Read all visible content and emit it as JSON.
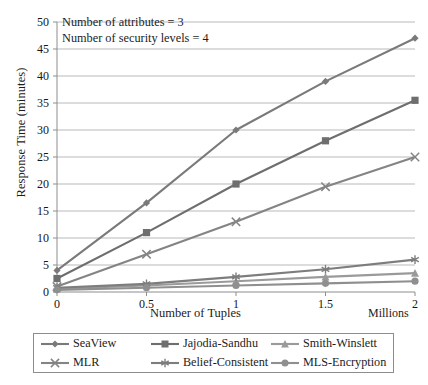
{
  "chart_data": {
    "type": "line",
    "title": "",
    "xlabel": "Number of Tuples",
    "xunits": "Millions",
    "ylabel": "Response Time (minutes)",
    "x": [
      0,
      0.5,
      1,
      1.5,
      2
    ],
    "xtick_labels": [
      "0",
      "0.5",
      "1",
      "1.5",
      "2"
    ],
    "ytick_labels": [
      "0",
      "5",
      "10",
      "15",
      "20",
      "25",
      "30",
      "35",
      "40",
      "45",
      "50"
    ],
    "xlim": [
      0,
      2
    ],
    "ylim": [
      0,
      50
    ],
    "grid": "horizontal",
    "legend_position": "below",
    "annotations": [
      "Number of attributes = 3",
      "Number of security levels = 4"
    ],
    "series": [
      {
        "name": "SeaView",
        "marker": "diamond",
        "color": "#7a7a7a",
        "values": [
          4,
          16.5,
          30,
          39,
          47
        ]
      },
      {
        "name": "Jajodia-Sandhu",
        "marker": "square",
        "color": "#6e6e6e",
        "values": [
          2.5,
          11,
          20,
          28,
          35.5
        ]
      },
      {
        "name": "Smith-Winslett",
        "marker": "triangle",
        "color": "#9a9a9a",
        "values": [
          0.6,
          1.2,
          2,
          2.8,
          3.5
        ]
      },
      {
        "name": "MLR",
        "marker": "cross",
        "color": "#848484",
        "values": [
          1,
          7,
          13,
          19.5,
          25
        ]
      },
      {
        "name": "Belief-Consistent",
        "marker": "asterisk",
        "color": "#7d7d7d",
        "values": [
          0.8,
          1.5,
          2.8,
          4.2,
          6
        ]
      },
      {
        "name": "MLS-Encryption",
        "marker": "circle",
        "color": "#8f8f8f",
        "values": [
          0.4,
          0.8,
          1.2,
          1.6,
          2
        ]
      }
    ]
  },
  "legend": {
    "items": [
      {
        "label": "SeaView",
        "marker": "diamond-marker-icon"
      },
      {
        "label": "Jajodia-Sandhu",
        "marker": "square-marker-icon"
      },
      {
        "label": "Smith-Winslett",
        "marker": "triangle-marker-icon"
      },
      {
        "label": "MLR",
        "marker": "cross-marker-icon"
      },
      {
        "label": "Belief-Consistent",
        "marker": "asterisk-marker-icon"
      },
      {
        "label": "MLS-Encryption",
        "marker": "circle-marker-icon"
      }
    ]
  }
}
